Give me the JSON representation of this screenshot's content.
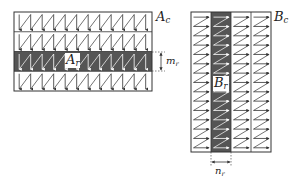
{
  "diagram": {
    "left": {
      "matrix_label": "A",
      "matrix_sub": "c",
      "block_label": "A",
      "block_sub": "r",
      "dim_label": "m",
      "dim_sub": "r",
      "rows": 4,
      "highlighted_row": 2,
      "columns": 12,
      "traversal": "column-major zigzag (down arrows)"
    },
    "right": {
      "matrix_label": "B",
      "matrix_sub": "c",
      "block_label": "B",
      "block_sub": "r",
      "dim_label": "n",
      "dim_sub": "r",
      "columns": 4,
      "highlighted_column": 1,
      "rows": 15,
      "traversal": "row-major zigzag (right arrows)"
    },
    "colors": {
      "line": "#333333",
      "highlight": "#555555",
      "highlight_arrow": "#ffffff",
      "background": "#ffffff"
    }
  }
}
